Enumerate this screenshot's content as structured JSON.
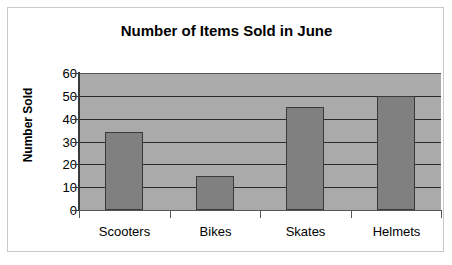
{
  "chart_data": {
    "type": "bar",
    "title": "Number of Items Sold in June",
    "xlabel": "",
    "ylabel": "Number Sold",
    "categories": [
      "Scooters",
      "Bikes",
      "Skates",
      "Helmets"
    ],
    "values": [
      34,
      15,
      45,
      50
    ],
    "ylim": [
      0,
      60
    ],
    "ytick_labels": [
      "60",
      "50",
      "40",
      "30",
      "20",
      "10",
      "0"
    ],
    "ytick_values": [
      60,
      50,
      40,
      30,
      20,
      10,
      0
    ],
    "ytick_step": 10,
    "grid": true,
    "legend": false,
    "colors": {
      "bar_fill": "#808080",
      "bar_edge": "#3a3a3a",
      "plot_background": "#aaaaaa",
      "gridline": "#2b2b2b",
      "figure_background": "#ffffff",
      "figure_border": "#c9c9c9",
      "text": "#000000"
    }
  }
}
